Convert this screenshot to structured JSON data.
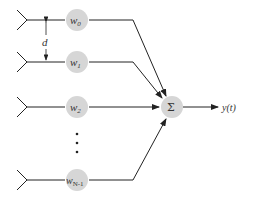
{
  "diagram": {
    "type": "antenna-array-beamformer",
    "elements": [
      {
        "weight": "w",
        "subscript": "0",
        "y": 20
      },
      {
        "weight": "w",
        "subscript": "1",
        "y": 62
      },
      {
        "weight": "w",
        "subscript": "2",
        "y": 107
      },
      {
        "weight": "w",
        "subscript": "N-1",
        "y": 180
      }
    ],
    "spacing_label": "d",
    "ellipsis": "⋮",
    "summer_label": "Σ",
    "output_label": "y(t)",
    "colors": {
      "node_fill": "#d6d6d6",
      "line": "#222222",
      "text": "#333333"
    }
  }
}
